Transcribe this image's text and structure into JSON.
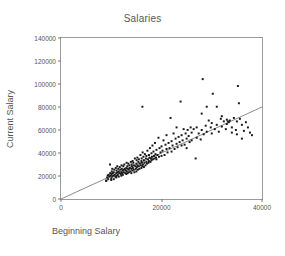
{
  "chart_data": {
    "type": "scatter",
    "title": "Salaries",
    "xlabel": "Beginning Salary",
    "ylabel": "Current Salary",
    "xlim": [
      0,
      40000
    ],
    "ylim": [
      0,
      140000
    ],
    "xticks": [
      0,
      20000,
      40000
    ],
    "yticks": [
      0,
      20000,
      40000,
      60000,
      80000,
      100000,
      120000,
      140000
    ],
    "xtick_labels": [
      "0",
      "20000",
      "40000"
    ],
    "ytick_labels": [
      "0",
      "20000",
      "40000",
      "60000",
      "80000",
      "100000",
      "120000",
      "140000"
    ],
    "grid": false,
    "legend": null,
    "marker": {
      "shape": "square",
      "size": 2,
      "color": "#1a1a1a"
    },
    "fit_line": {
      "name": "linear regression",
      "color": "#555555",
      "x": [
        0,
        40000
      ],
      "y": [
        0,
        80000
      ],
      "slope": 2.0,
      "intercept": 0
    },
    "points": [
      [
        9000,
        15750
      ],
      [
        9000,
        16050
      ],
      [
        9200,
        18750
      ],
      [
        9300,
        20500
      ],
      [
        9400,
        17250
      ],
      [
        9500,
        21000
      ],
      [
        9600,
        19500
      ],
      [
        9750,
        30000
      ],
      [
        9800,
        22500
      ],
      [
        9900,
        20250
      ],
      [
        10000,
        16500
      ],
      [
        10000,
        18000
      ],
      [
        10050,
        21750
      ],
      [
        10100,
        24000
      ],
      [
        10200,
        19500
      ],
      [
        10200,
        26250
      ],
      [
        10300,
        22500
      ],
      [
        10400,
        20250
      ],
      [
        10500,
        17250
      ],
      [
        10500,
        23250
      ],
      [
        10600,
        25500
      ],
      [
        10700,
        21000
      ],
      [
        10800,
        19500
      ],
      [
        10900,
        27000
      ],
      [
        11000,
        18750
      ],
      [
        11000,
        22500
      ],
      [
        11050,
        24750
      ],
      [
        11100,
        20250
      ],
      [
        11200,
        28500
      ],
      [
        11250,
        23250
      ],
      [
        11300,
        21000
      ],
      [
        11400,
        26250
      ],
      [
        11500,
        19500
      ],
      [
        11500,
        24000
      ],
      [
        11600,
        22500
      ],
      [
        11700,
        27750
      ],
      [
        11800,
        25500
      ],
      [
        11900,
        21750
      ],
      [
        12000,
        20250
      ],
      [
        12000,
        23250
      ],
      [
        12050,
        29250
      ],
      [
        12100,
        26250
      ],
      [
        12200,
        22500
      ],
      [
        12250,
        24750
      ],
      [
        12300,
        21000
      ],
      [
        12400,
        28500
      ],
      [
        12500,
        25500
      ],
      [
        12500,
        23250
      ],
      [
        12600,
        30000
      ],
      [
        12700,
        26250
      ],
      [
        12800,
        22500
      ],
      [
        12900,
        24750
      ],
      [
        13000,
        21750
      ],
      [
        13000,
        27000
      ],
      [
        13050,
        31500
      ],
      [
        13100,
        24000
      ],
      [
        13200,
        28500
      ],
      [
        13250,
        22500
      ],
      [
        13300,
        26250
      ],
      [
        13400,
        30750
      ],
      [
        13500,
        23250
      ],
      [
        13500,
        25500
      ],
      [
        13600,
        29250
      ],
      [
        13700,
        27000
      ],
      [
        13800,
        24000
      ],
      [
        13900,
        32250
      ],
      [
        14000,
        22500
      ],
      [
        14000,
        26250
      ],
      [
        14050,
        30000
      ],
      [
        14100,
        28500
      ],
      [
        14200,
        24750
      ],
      [
        14250,
        33000
      ],
      [
        14300,
        27000
      ],
      [
        14400,
        31500
      ],
      [
        14500,
        25500
      ],
      [
        14500,
        29250
      ],
      [
        14600,
        23250
      ],
      [
        14700,
        35250
      ],
      [
        14800,
        28500
      ],
      [
        14900,
        26250
      ],
      [
        15000,
        24000
      ],
      [
        15000,
        30750
      ],
      [
        15050,
        33750
      ],
      [
        15100,
        27750
      ],
      [
        15200,
        36000
      ],
      [
        15250,
        29250
      ],
      [
        15300,
        25500
      ],
      [
        15400,
        32250
      ],
      [
        15500,
        28500
      ],
      [
        15500,
        34500
      ],
      [
        15600,
        26250
      ],
      [
        15700,
        30750
      ],
      [
        15800,
        38250
      ],
      [
        15900,
        29250
      ],
      [
        16000,
        27000
      ],
      [
        16000,
        33000
      ],
      [
        16050,
        35250
      ],
      [
        16100,
        31500
      ],
      [
        16200,
        28500
      ],
      [
        16250,
        40500
      ],
      [
        16300,
        30000
      ],
      [
        16400,
        36750
      ],
      [
        16500,
        27750
      ],
      [
        16500,
        33750
      ],
      [
        16600,
        31500
      ],
      [
        16700,
        39000
      ],
      [
        16800,
        29250
      ],
      [
        16900,
        35250
      ],
      [
        17000,
        32250
      ],
      [
        17000,
        37500
      ],
      [
        17100,
        30750
      ],
      [
        17200,
        42000
      ],
      [
        17300,
        34500
      ],
      [
        17400,
        31500
      ],
      [
        17500,
        38250
      ],
      [
        17500,
        33000
      ],
      [
        17600,
        36000
      ],
      [
        17700,
        44250
      ],
      [
        17800,
        32250
      ],
      [
        17900,
        35250
      ],
      [
        16200,
        80250
      ],
      [
        18000,
        33750
      ],
      [
        18000,
        39750
      ],
      [
        18100,
        36750
      ],
      [
        18200,
        46500
      ],
      [
        18300,
        34500
      ],
      [
        18400,
        41250
      ],
      [
        18500,
        37500
      ],
      [
        18600,
        35250
      ],
      [
        18700,
        48750
      ],
      [
        18800,
        39000
      ],
      [
        18900,
        36000
      ],
      [
        19000,
        42750
      ],
      [
        19000,
        34500
      ],
      [
        19200,
        38250
      ],
      [
        19400,
        53250
      ],
      [
        19500,
        36750
      ],
      [
        19600,
        44250
      ],
      [
        19800,
        40500
      ],
      [
        20000,
        37500
      ],
      [
        20000,
        45750
      ],
      [
        20200,
        42000
      ],
      [
        20400,
        51000
      ],
      [
        20600,
        38250
      ],
      [
        20800,
        47250
      ],
      [
        21000,
        43500
      ],
      [
        21000,
        55500
      ],
      [
        21200,
        40500
      ],
      [
        21400,
        48750
      ],
      [
        21600,
        44250
      ],
      [
        21800,
        70500
      ],
      [
        22000,
        41250
      ],
      [
        22000,
        50250
      ],
      [
        22200,
        46500
      ],
      [
        22400,
        57000
      ],
      [
        22600,
        43500
      ],
      [
        22800,
        52500
      ],
      [
        23000,
        48000
      ],
      [
        23000,
        62250
      ],
      [
        23200,
        45000
      ],
      [
        23400,
        54000
      ],
      [
        23600,
        49500
      ],
      [
        23800,
        84750
      ],
      [
        24000,
        46500
      ],
      [
        24000,
        55500
      ],
      [
        24200,
        51000
      ],
      [
        24400,
        60750
      ],
      [
        24600,
        47250
      ],
      [
        24800,
        57000
      ],
      [
        25000,
        52500
      ],
      [
        25000,
        44250
      ],
      [
        25200,
        60000
      ],
      [
        25400,
        54750
      ],
      [
        25600,
        49500
      ],
      [
        25800,
        62250
      ],
      [
        26000,
        51000
      ],
      [
        26000,
        57750
      ],
      [
        26400,
        60750
      ],
      [
        26800,
        35250
      ],
      [
        27000,
        53250
      ],
      [
        27000,
        62250
      ],
      [
        27400,
        57000
      ],
      [
        27800,
        51750
      ],
      [
        28000,
        60000
      ],
      [
        28000,
        74250
      ],
      [
        28200,
        104250
      ],
      [
        28400,
        56250
      ],
      [
        28800,
        63750
      ],
      [
        29000,
        58500
      ],
      [
        29000,
        80250
      ],
      [
        29400,
        68250
      ],
      [
        29800,
        62250
      ],
      [
        30000,
        57000
      ],
      [
        30000,
        66000
      ],
      [
        30200,
        91500
      ],
      [
        30600,
        60750
      ],
      [
        31000,
        64500
      ],
      [
        31000,
        80250
      ],
      [
        31400,
        58500
      ],
      [
        31800,
        69750
      ],
      [
        32000,
        63000
      ],
      [
        32000,
        72000
      ],
      [
        32400,
        67500
      ],
      [
        32800,
        60750
      ],
      [
        33000,
        65250
      ],
      [
        33000,
        69000
      ],
      [
        33200,
        67500
      ],
      [
        33400,
        66750
      ],
      [
        33600,
        68250
      ],
      [
        34000,
        62250
      ],
      [
        34000,
        57750
      ],
      [
        34400,
        70500
      ],
      [
        34800,
        60000
      ],
      [
        35000,
        67500
      ],
      [
        35000,
        56250
      ],
      [
        35200,
        98250
      ],
      [
        35400,
        83250
      ],
      [
        35600,
        69750
      ],
      [
        36000,
        64500
      ],
      [
        36000,
        52500
      ],
      [
        36400,
        59250
      ],
      [
        36800,
        66750
      ],
      [
        37200,
        62250
      ],
      [
        37600,
        57750
      ],
      [
        38000,
        55500
      ]
    ],
    "point_count": 214
  }
}
